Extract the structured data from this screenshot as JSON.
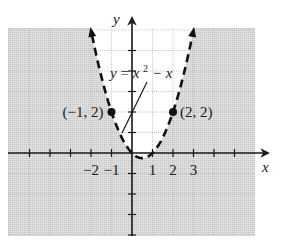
{
  "chart_data": {
    "type": "line",
    "title": "",
    "equation_label": "y = x² − x",
    "equation": {
      "lhs": "y",
      "rhs_base": "x",
      "rhs_exp": "2",
      "rhs_rest": "− x"
    },
    "xlabel": "x",
    "ylabel": "y",
    "xlim": [
      -6,
      6
    ],
    "ylim": [
      -4,
      6
    ],
    "grid": true,
    "boundary_style": "dashed",
    "shaded_region": "y < x² − x",
    "x_tick_labels": [
      "−2",
      "−1",
      "1",
      "2",
      "3"
    ],
    "x_tick_values": [
      -2,
      -1,
      1,
      2,
      3
    ],
    "points": [
      {
        "label": "(−1, 2)",
        "x": -1,
        "y": 2
      },
      {
        "label": "(2, 2)",
        "x": 2,
        "y": 2
      }
    ],
    "curve_samples": {
      "x": [
        -2,
        -1.5,
        -1,
        -0.5,
        0,
        0.5,
        1,
        1.5,
        2,
        2.5,
        3
      ],
      "y": [
        6,
        3.75,
        2,
        0.75,
        0,
        -0.25,
        0,
        0.75,
        2,
        3.75,
        6
      ]
    }
  },
  "colors": {
    "shade": "#d6d6d6",
    "grid_shaded": "#a9a9a9",
    "grid_unshaded": "#cfcfcf",
    "axis": "#1a1a1a",
    "curve": "#111111"
  }
}
